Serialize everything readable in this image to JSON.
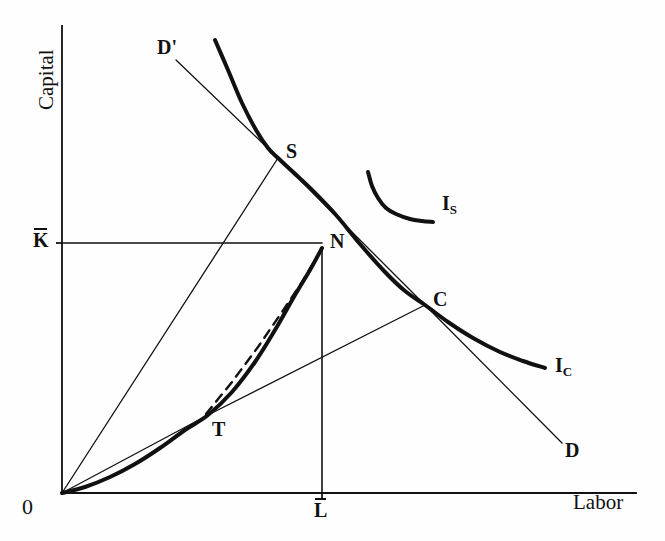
{
  "figure": {
    "domain": "economics-diagram",
    "background": "#fefefe",
    "ink": "#111111",
    "axes": {
      "y_label": "Capital",
      "x_label": "Labor",
      "origin_label": "0",
      "y_tick_label": "K",
      "y_tick_has_overbar": true,
      "x_tick_label": "L",
      "x_tick_has_overbar": true
    },
    "points": [
      {
        "id": "S",
        "label": "S",
        "x": 278,
        "y": 158,
        "desc": "tangency of price line D'D with indifference curve"
      },
      {
        "id": "C",
        "label": "C",
        "x": 425,
        "y": 305,
        "desc": "consumption point on lower indifference curve"
      },
      {
        "id": "N",
        "label": "N",
        "x": 322,
        "y": 248,
        "desc": "endowment / production corner point"
      },
      {
        "id": "T",
        "label": "T",
        "x": 208,
        "y": 415,
        "desc": "tangency of ray from origin with production curve"
      }
    ],
    "curve_labels": [
      {
        "id": "I_S",
        "base": "I",
        "sub": "S",
        "x": 443,
        "y": 198
      },
      {
        "id": "I_C",
        "base": "I",
        "sub": "C",
        "x": 556,
        "y": 358
      }
    ],
    "line_labels": [
      {
        "id": "D_prime",
        "label": "D'",
        "x": 158,
        "y": 38
      },
      {
        "id": "D",
        "label": "D",
        "x": 566,
        "y": 440
      }
    ]
  },
  "chart_data": {
    "type": "line",
    "title": "",
    "xlabel": "Labor",
    "ylabel": "Capital",
    "xlim": [
      0,
      665
    ],
    "ylim": [
      0,
      541
    ],
    "grid": false,
    "legend": "none",
    "axes_pixels": {
      "origin": [
        62,
        493
      ],
      "y_axis_top": [
        62,
        26
      ],
      "x_axis_right": [
        636,
        493
      ],
      "k_bar_y": 243,
      "l_bar_x": 322
    },
    "series": [
      {
        "name": "I_C",
        "style": "thick-solid",
        "width": 4,
        "label": "I_C",
        "points": [
          [
            215,
            40
          ],
          [
            228,
            70
          ],
          [
            242,
            103
          ],
          [
            256,
            130
          ],
          [
            268,
            148
          ],
          [
            278,
            158
          ],
          [
            293,
            172
          ],
          [
            312,
            190
          ],
          [
            336,
            215
          ],
          [
            360,
            244
          ],
          [
            385,
            272
          ],
          [
            405,
            291
          ],
          [
            425,
            305
          ],
          [
            448,
            322
          ],
          [
            473,
            338
          ],
          [
            500,
            352
          ],
          [
            523,
            361
          ],
          [
            545,
            368
          ]
        ]
      },
      {
        "name": "I_S",
        "style": "thick-solid",
        "width": 4,
        "label": "I_S",
        "points": [
          [
            368,
            172
          ],
          [
            372,
            186
          ],
          [
            378,
            198
          ],
          [
            386,
            208
          ],
          [
            396,
            214
          ],
          [
            410,
            219
          ],
          [
            422,
            221
          ],
          [
            433,
            222
          ]
        ]
      },
      {
        "name": "price-line-D'D",
        "style": "thin-solid",
        "width": 1.3,
        "label": "D' ... D",
        "points": [
          [
            176,
            60
          ],
          [
            278,
            158
          ],
          [
            425,
            305
          ],
          [
            562,
            443
          ]
        ]
      },
      {
        "name": "production-curve-O-T-N",
        "style": "thick-solid",
        "width": 4,
        "label": "",
        "points": [
          [
            62,
            493
          ],
          [
            85,
            487
          ],
          [
            110,
            477
          ],
          [
            135,
            464
          ],
          [
            160,
            448
          ],
          [
            185,
            430
          ],
          [
            208,
            415
          ],
          [
            232,
            392
          ],
          [
            255,
            362
          ],
          [
            275,
            330
          ],
          [
            295,
            295
          ],
          [
            310,
            270
          ],
          [
            322,
            248
          ]
        ]
      },
      {
        "name": "chord-T-N-dashed",
        "style": "dashed",
        "width": 2.4,
        "label": "",
        "points": [
          [
            206,
            414
          ],
          [
            232,
            382
          ],
          [
            258,
            347
          ],
          [
            282,
            312
          ],
          [
            302,
            282
          ],
          [
            318,
            255
          ]
        ]
      },
      {
        "name": "ray-O-S",
        "style": "thin-solid",
        "width": 1.3,
        "label": "",
        "points": [
          [
            62,
            493
          ],
          [
            278,
            158
          ]
        ]
      },
      {
        "name": "ray-O-T-C",
        "style": "thin-solid",
        "width": 1.3,
        "label": "",
        "points": [
          [
            62,
            493
          ],
          [
            208,
            415
          ],
          [
            425,
            305
          ]
        ]
      },
      {
        "name": "k-bar-horizontal",
        "style": "thin-solid",
        "width": 1.6,
        "label": "",
        "points": [
          [
            62,
            243
          ],
          [
            322,
            243
          ]
        ]
      },
      {
        "name": "l-bar-vertical",
        "style": "thin-solid",
        "width": 1.6,
        "label": "",
        "points": [
          [
            322,
            248
          ],
          [
            322,
            493
          ]
        ]
      }
    ],
    "annotations": [
      {
        "text": "S",
        "x": 286,
        "y": 148
      },
      {
        "text": "C",
        "x": 433,
        "y": 296
      },
      {
        "text": "N",
        "x": 330,
        "y": 239
      },
      {
        "text": "T",
        "x": 214,
        "y": 427
      },
      {
        "text": "D'",
        "x": 158,
        "y": 38
      },
      {
        "text": "D",
        "x": 566,
        "y": 440
      },
      {
        "text": "I_S",
        "x": 443,
        "y": 198
      },
      {
        "text": "I_C",
        "x": 556,
        "y": 358
      },
      {
        "text": "0",
        "x": 24,
        "y": 500
      },
      {
        "text": "K̄",
        "x": 34,
        "y": 232
      },
      {
        "text": "L̄",
        "x": 314,
        "y": 502
      },
      {
        "text": "Capital",
        "x": 30,
        "y": 100,
        "rotation": -90
      },
      {
        "text": "Labor",
        "x": 576,
        "y": 500
      }
    ]
  }
}
